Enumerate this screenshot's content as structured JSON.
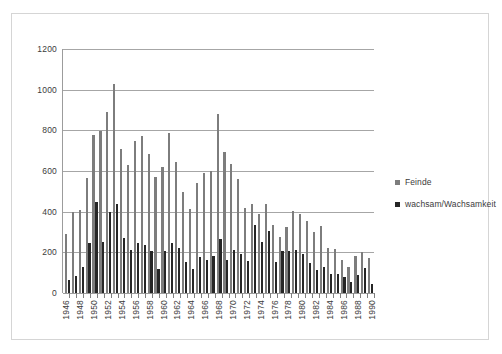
{
  "chart_data": {
    "type": "bar",
    "title": "",
    "subtitle": "",
    "xlabel": "",
    "ylabel": "",
    "ylim": [
      0,
      1200
    ],
    "yticks": [
      0,
      200,
      400,
      600,
      800,
      1000,
      1200
    ],
    "grid": "horizontal",
    "legend_position": "right",
    "xtick_step": 2,
    "categories": [
      "1946",
      "1947",
      "1948",
      "1949",
      "1950",
      "1951",
      "1952",
      "1953",
      "1954",
      "1955",
      "1956",
      "1957",
      "1958",
      "1959",
      "1960",
      "1961",
      "1962",
      "1963",
      "1964",
      "1965",
      "1966",
      "1967",
      "1968",
      "1969",
      "1970",
      "1971",
      "1972",
      "1973",
      "1974",
      "1975",
      "1976",
      "1977",
      "1978",
      "1979",
      "1980",
      "1981",
      "1982",
      "1983",
      "1984",
      "1985",
      "1986",
      "1987",
      "1988",
      "1989",
      "1990"
    ],
    "tick_labels": [
      "1946",
      "",
      "1948",
      "",
      "1950",
      "",
      "1952",
      "",
      "1954",
      "",
      "1956",
      "",
      "1958",
      "",
      "1960",
      "",
      "1962",
      "",
      "1964",
      "",
      "1966",
      "",
      "1968",
      "",
      "1970",
      "",
      "1972",
      "",
      "1974",
      "",
      "1976",
      "",
      "1978",
      "",
      "1980",
      "",
      "1982",
      "",
      "1984",
      "",
      "1986",
      "",
      "1988",
      "",
      "1990"
    ],
    "series": [
      {
        "name": "Feinde",
        "color": "#7d7d7d",
        "values": [
          288,
          400,
          408,
          565,
          775,
          795,
          888,
          1030,
          710,
          630,
          748,
          770,
          685,
          572,
          618,
          785,
          645,
          497,
          412,
          540,
          590,
          602,
          880,
          695,
          633,
          562,
          420,
          440,
          388,
          440,
          333,
          277,
          325,
          405,
          388,
          352,
          300,
          332,
          222,
          218,
          163,
          130,
          180,
          203,
          173
        ]
      },
      {
        "name": "wachsam/Wachsamkeit",
        "color": "#262626",
        "values": [
          65,
          82,
          130,
          247,
          450,
          250,
          400,
          440,
          270,
          213,
          248,
          237,
          208,
          120,
          207,
          248,
          222,
          154,
          119,
          179,
          163,
          180,
          266,
          163,
          211,
          192,
          155,
          334,
          253,
          307,
          153,
          208,
          205,
          210,
          192,
          150,
          113,
          130,
          95,
          94,
          78,
          55,
          88,
          122,
          43
        ]
      }
    ]
  },
  "legend": {
    "items": [
      {
        "label": "Feinde",
        "swatch": "#7d7d7d"
      },
      {
        "label": "wachsam/Wachsamkeit",
        "swatch": "#262626"
      }
    ]
  }
}
